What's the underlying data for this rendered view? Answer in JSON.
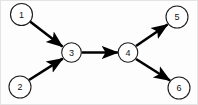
{
  "figure": {
    "kind": "directed-graph",
    "title": "",
    "width": 198,
    "height": 105,
    "background_color": "#fdfdfd",
    "node_fill_color": "#ffffff",
    "node_stroke_color": "#1c1c1c",
    "edge_color": "#000000",
    "label_color": "#141414"
  },
  "nodes": [
    {
      "id": "1",
      "label": "1",
      "cx": 21.5,
      "cy": 14.5,
      "r": 11.0
    },
    {
      "id": "2",
      "label": "2",
      "cx": 20.0,
      "cy": 87.0,
      "r": 11.0
    },
    {
      "id": "3",
      "label": "3",
      "cx": 71.5,
      "cy": 52.5,
      "r": 9.8
    },
    {
      "id": "4",
      "label": "4",
      "cx": 128.0,
      "cy": 52.5,
      "r": 9.8
    },
    {
      "id": "5",
      "label": "5",
      "cx": 177.0,
      "cy": 17.0,
      "r": 11.0
    },
    {
      "id": "6",
      "label": "6",
      "cx": 179.0,
      "cy": 88.0,
      "r": 11.0
    }
  ],
  "edges": [
    {
      "id": "e1",
      "from": "1",
      "to": "3",
      "label": "",
      "directed": true,
      "x1": 30.0,
      "y1": 21.5,
      "x2": 62.5,
      "y2": 46.5,
      "width": 2.6
    },
    {
      "id": "e2",
      "from": "2",
      "to": "3",
      "label": "",
      "directed": true,
      "x1": 29.0,
      "y1": 80.0,
      "x2": 62.8,
      "y2": 58.6,
      "width": 2.6
    },
    {
      "id": "e3",
      "from": "3",
      "to": "4",
      "label": "",
      "directed": true,
      "x1": 81.5,
      "y1": 52.5,
      "x2": 117.8,
      "y2": 52.5,
      "width": 2.6
    },
    {
      "id": "e4",
      "from": "4",
      "to": "5",
      "label": "",
      "directed": true,
      "x1": 136.0,
      "y1": 46.0,
      "x2": 167.5,
      "y2": 24.5,
      "width": 2.6
    },
    {
      "id": "e5",
      "from": "4",
      "to": "6",
      "label": "",
      "directed": true,
      "x1": 136.0,
      "y1": 59.0,
      "x2": 170.0,
      "y2": 80.5,
      "width": 2.6
    }
  ],
  "legend": {
    "visible": false,
    "items": []
  },
  "annotations": []
}
